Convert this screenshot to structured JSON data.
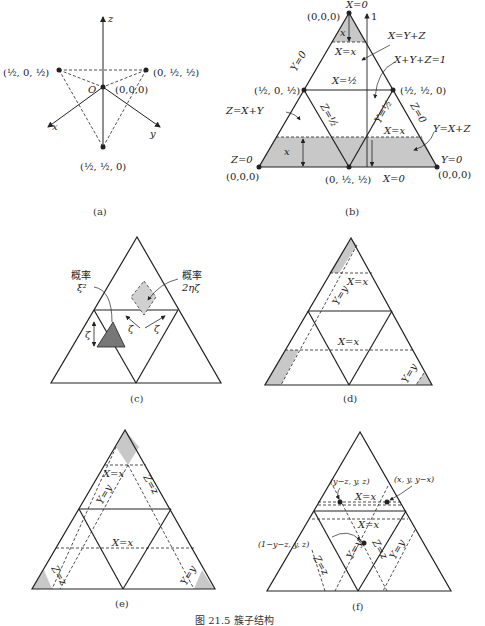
{
  "figure": {
    "caption": "图 21.5  簇子结构",
    "panels": [
      {
        "id": "a",
        "label": "(a)"
      },
      {
        "id": "b",
        "label": "(b)"
      },
      {
        "id": "c",
        "label": "(c)"
      },
      {
        "id": "d",
        "label": "(d)"
      },
      {
        "id": "e",
        "label": "(e)"
      },
      {
        "id": "f",
        "label": "(f)"
      }
    ]
  },
  "panel_a": {
    "axis_z": "z",
    "axis_x": "x",
    "axis_y": "y",
    "origin": "O",
    "origin_coord": "(0,0,0)",
    "pt_left": "(½, 0, ½)",
    "pt_right": "(0, ½, ½)",
    "pt_bottom": "(½, ½, 0)"
  },
  "panel_b": {
    "top_label": "X=0",
    "apex_coord": "(0,0,0)",
    "one": "1",
    "x_eq_y_plus_z": "X=Y+Z",
    "x_plus_y_plus_z": "X+Y+Z=1",
    "x_eq_x_top": "X=x",
    "y0": "Y=0",
    "x_half": "X=½",
    "pt_left": "(½, 0, ½)",
    "pt_right": "(½, ½, 0)",
    "z_eq_x_plus_y": "Z=X+Y",
    "z_half": "Z=½",
    "y_half": "Y=½",
    "z0_right": "Z=0",
    "x_eq_x_bottom": "X=x",
    "y_eq_x_plus_z": "Y=X+Z",
    "x_small": "x",
    "z0_left": "Z=0",
    "coord_bl": "(0,0,0)",
    "coord_br": "(0,0,0)",
    "y0_right": "Y=0",
    "pt_bottom": "(0, ½, ½)",
    "x0_bottom": "X=0",
    "x_small_top": "x"
  },
  "panel_c": {
    "prob_left_1": "概率",
    "prob_left_2": "ξ²",
    "prob_right_1": "概率",
    "prob_right_2": "2ηζ",
    "zeta_left": "ζ",
    "zeta_mid": "ζ",
    "zeta_right": "ζ"
  },
  "panel_d": {
    "x_eq_x_top": "X=x",
    "y_eq_y_left": "Y=y",
    "x_eq_x_mid": "X=x",
    "y_eq_y_right": "Y=y"
  },
  "panel_e": {
    "x_eq_x_top": "X=x",
    "y_eq_y": "Y=y",
    "z_eq_z_top": "Z=z",
    "x_eq_x_mid": "X=x",
    "z_eq_z_bottom": "Z=z",
    "y_eq_y_right": "Y=y"
  },
  "panel_f": {
    "pt1": "(y−z, y, z)",
    "pt2": "(x, y, y−x)",
    "x_eq_x_1": "X=x",
    "x_eq_x_2": "X=x",
    "pt3": "(1−y−z, y, z)",
    "y_eq_y_1": "Y=y",
    "z_eq_z_1": "Z=z",
    "y_eq_y_2": "Y=y",
    "z_eq_z_2": "Z=z"
  },
  "colors": {
    "line": "#222222",
    "shade_light": "#c8c8c8",
    "shade_dark": "#777777"
  }
}
